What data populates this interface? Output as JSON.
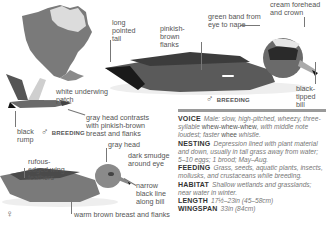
{
  "map": {
    "label": "range map of North America"
  },
  "male_breeding": {
    "sex_label": "BREEDING",
    "sex_symbol": "♂",
    "callouts": {
      "tail": "long pointed tail",
      "flanks": "pinkish-brown flanks",
      "band": "green band from eye to nape",
      "forehead": "cream forehead and crown",
      "bill": "black-tipped bill"
    }
  },
  "male_flight": {
    "sex_label": "BREEDING",
    "sex_symbol": "♂",
    "callouts": {
      "underwing": "white underwing patch",
      "rump": "black rump",
      "head": "gray head contrasts with pinkish-brown breast and flanks"
    }
  },
  "female": {
    "sex_symbol": "♀",
    "callouts": {
      "head": "gray head",
      "eye": "dark smudge around eye",
      "wing": "rufous-edged wing feathers",
      "bill": "narrow black line along bill",
      "breast": "warm brown breast and flanks"
    }
  },
  "info": {
    "voice": {
      "label": "VOICE",
      "text1": "Male: slow, high-pitched, wheezy, three-syllable ",
      "plain1": "whew-whew-whew",
      "text2": ", with middle note loudest; faster ",
      "plain2": "whee",
      "text3": " whistle."
    },
    "nesting": {
      "label": "NESTING",
      "text": "Depression lined with plant material and down, usually in tall grass away from water; 5–10 eggs; 1 brood; May–Aug."
    },
    "feeding": {
      "label": "FEEDING",
      "text": "Grass, seeds, aquatic plants, insects, mollusks, and crustaceans while breeding."
    },
    "habitat": {
      "label": "HABITAT",
      "text": "Shallow wetlands and grasslands; near water in winter."
    },
    "length": {
      "label": "LENGTH",
      "text": "17½–23in (45–58cm)"
    },
    "wingspan": {
      "label": "WINGSPAN",
      "text": "33in (84cm)"
    }
  }
}
